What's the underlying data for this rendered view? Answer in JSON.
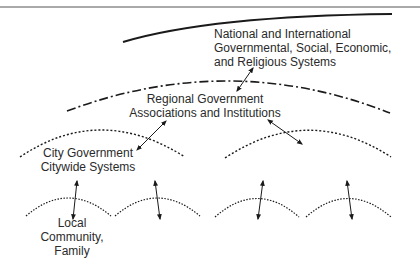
{
  "diagram": {
    "type": "nested-systems-hierarchy",
    "levels": [
      {
        "id": "national",
        "lines": [
          "National and International",
          "Governmental, Social, Economic,",
          "and Religious Systems"
        ],
        "boundary_style": "solid"
      },
      {
        "id": "regional",
        "lines": [
          "Regional Government",
          "Associations and Institutions"
        ],
        "boundary_style": "dash-dot"
      },
      {
        "id": "city",
        "lines": [
          "City Government",
          "Citywide Systems"
        ],
        "boundary_style": "dotted",
        "count": 2
      },
      {
        "id": "local",
        "lines": [
          "Local",
          "Community,",
          "Family"
        ],
        "boundary_style": "dotted",
        "count": 4
      }
    ],
    "connections": [
      {
        "from": "national",
        "to": "regional",
        "type": "bidirectional-arrow"
      },
      {
        "from": "regional",
        "to": "city-left",
        "type": "bidirectional-arrow"
      },
      {
        "from": "regional",
        "to": "city-right",
        "type": "bidirectional-arrow"
      },
      {
        "from": "city-left",
        "to": "local-1",
        "type": "bidirectional-arrow"
      },
      {
        "from": "city-left",
        "to": "local-2",
        "type": "bidirectional-arrow"
      },
      {
        "from": "city-right",
        "to": "local-3",
        "type": "bidirectional-arrow"
      },
      {
        "from": "city-right",
        "to": "local-4",
        "type": "bidirectional-arrow"
      }
    ],
    "colors": {
      "line": "#1a1a1a",
      "background": "#ffffff"
    }
  }
}
